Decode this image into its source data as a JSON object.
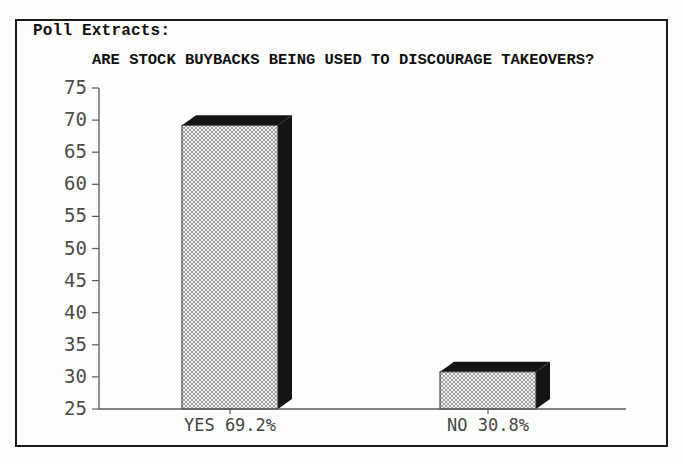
{
  "header": {
    "title": "Poll Extracts:"
  },
  "chart_data": {
    "type": "bar",
    "style": "3d-block-hatched",
    "title": "ARE STOCK BUYBACKS BEING USED TO DISCOURAGE TAKEOVERS?",
    "categories": [
      "YES 69.2%",
      "NO 30.8%"
    ],
    "values": [
      69.2,
      30.8
    ],
    "xlabel": "",
    "ylabel": "",
    "ylim": [
      25,
      75
    ],
    "yticks": [
      75,
      70,
      65,
      60,
      55,
      50,
      45,
      40,
      35,
      30,
      25
    ],
    "grid": false,
    "legend": "none"
  },
  "colors": {
    "background": "#fdfdfc",
    "frame_border": "#1b1b1b",
    "bar_front_base": "#eeeeee",
    "bar_hatch": "#999999",
    "bar_side": "#141414",
    "axis_line": "#5a5a5a",
    "axis_text": "#4c4c4c",
    "heading_text": "#0d0d0d"
  }
}
